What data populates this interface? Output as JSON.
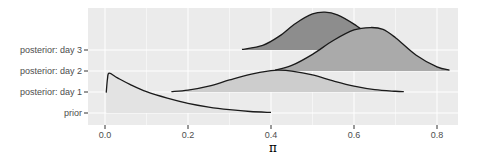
{
  "chart_data": {
    "type": "area",
    "subtype": "ridgeline",
    "title": "",
    "xlabel": "π",
    "ylabel": "",
    "xlim": [
      -0.04,
      0.87
    ],
    "x_ticks": [
      0.0,
      0.2,
      0.4,
      0.6,
      0.8
    ],
    "x_tick_labels": [
      "0.0",
      "0.2",
      "0.4",
      "0.6",
      "0.8"
    ],
    "categories": [
      "prior",
      "posterior: day 1",
      "posterior: day 2",
      "posterior: day 3"
    ],
    "grid": true,
    "legend": "none",
    "series": [
      {
        "name": "prior",
        "fill": "#e3e3e3",
        "x": [
          0.003,
          0.006,
          0.01,
          0.03,
          0.06,
          0.1,
          0.15,
          0.2,
          0.25,
          0.3,
          0.35,
          0.4
        ],
        "height": [
          1.1,
          1.85,
          2.15,
          1.9,
          1.55,
          1.15,
          0.8,
          0.52,
          0.32,
          0.18,
          0.08,
          0.03
        ]
      },
      {
        "name": "posterior: day 1",
        "fill": "#cdcdcd",
        "x": [
          0.16,
          0.2,
          0.25,
          0.3,
          0.35,
          0.4,
          0.42,
          0.45,
          0.5,
          0.55,
          0.6,
          0.65,
          0.7,
          0.72
        ],
        "height": [
          0.02,
          0.1,
          0.32,
          0.65,
          0.95,
          1.15,
          1.18,
          1.13,
          0.92,
          0.6,
          0.32,
          0.13,
          0.04,
          0.02
        ]
      },
      {
        "name": "posterior: day 2",
        "fill": "#aaaaaa",
        "x": [
          0.41,
          0.45,
          0.5,
          0.55,
          0.6,
          0.64,
          0.67,
          0.7,
          0.75,
          0.8,
          0.83
        ],
        "height": [
          0.05,
          0.3,
          0.9,
          1.65,
          2.22,
          2.35,
          2.25,
          1.8,
          0.85,
          0.22,
          0.05
        ]
      },
      {
        "name": "posterior: day 3",
        "fill": "#8d8d8d",
        "x": [
          0.33,
          0.38,
          0.42,
          0.46,
          0.5,
          0.53,
          0.56,
          0.6,
          0.64,
          0.68,
          0.71
        ],
        "height": [
          0.03,
          0.25,
          0.75,
          1.45,
          1.95,
          2.05,
          1.9,
          1.4,
          0.75,
          0.25,
          0.05
        ]
      }
    ]
  },
  "axis": {
    "y_labels": [
      "posterior: day 3",
      "posterior: day 2",
      "posterior: day 1",
      "prior"
    ],
    "x_labels": [
      "0.0",
      "0.2",
      "0.4",
      "0.6",
      "0.8"
    ],
    "x_title": "π"
  },
  "style": {
    "panel_bg": "#ebebeb",
    "grid_color": "#ffffff",
    "line_color": "#1a1a1a",
    "tick_color": "#333333",
    "label_color": "#4d4d4d"
  }
}
